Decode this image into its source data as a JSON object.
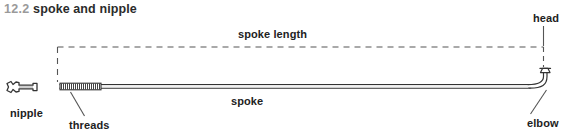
{
  "figure": {
    "number": "12.2",
    "title": "spoke and nipple",
    "width": 566,
    "height": 132,
    "background_color": "#ffffff",
    "line_color": "#333333",
    "number_color": "#9a9a9a",
    "title_color": "#2b2b2b"
  },
  "labels": {
    "spoke_length": "spoke length",
    "spoke": "spoke",
    "nipple": "nipple",
    "threads": "threads",
    "head": "head",
    "elbow": "elbow"
  },
  "parts": [
    {
      "name": "nipple",
      "label": "nipple",
      "description": "flared hollow nut at left end"
    },
    {
      "name": "threads",
      "label": "threads",
      "description": "hatched threaded section of spoke near nipple"
    },
    {
      "name": "spoke",
      "label": "spoke",
      "description": "long straight shaft"
    },
    {
      "name": "elbow",
      "label": "elbow",
      "description": "J-bend at right end of spoke"
    },
    {
      "name": "head",
      "label": "head",
      "description": "button head atop the elbow"
    }
  ],
  "dimension": {
    "label": "spoke length",
    "style": "dashed",
    "from_part": "threads",
    "to_part": "head"
  }
}
